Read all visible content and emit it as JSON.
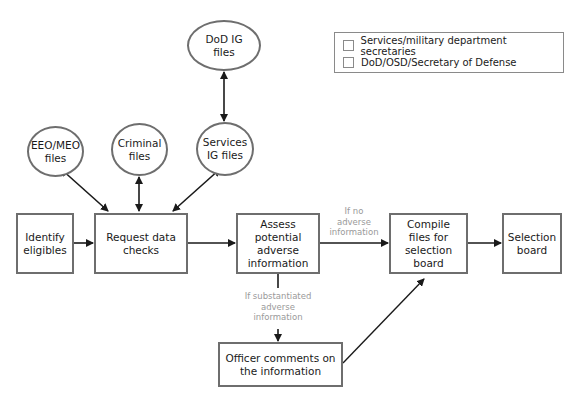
{
  "legend": {
    "items": [
      {
        "label": "Services/military department secretaries",
        "color": "#ffffff"
      },
      {
        "label": "DoD/OSD/Secretary of Defense",
        "color": "#ffffff"
      }
    ]
  },
  "nodes": {
    "dod_ig": "DoD IG\nfiles",
    "eeo_meo": "EEO/MEO\nfiles",
    "criminal": "Criminal\nfiles",
    "services_ig": "Services\nIG files",
    "identify": "Identify\neligibles",
    "request": "Request data\nchecks",
    "assess": "Assess\npotential\nadverse\ninformation",
    "compile": "Compile\nfiles for\nselection\nboard",
    "selection": "Selection\nboard",
    "officer": "Officer comments on\nthe information"
  },
  "conditions": {
    "no_adverse": "If no\nadverse\ninformation",
    "substantiated": "If substantiated\nadverse\ninformation"
  },
  "colors": {
    "stroke": "#6e6e6e",
    "arrow": "#1a1a1a",
    "condition_text": "#9a9a9a"
  }
}
